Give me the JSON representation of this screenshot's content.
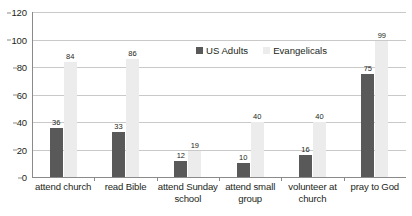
{
  "chart_data": {
    "type": "bar",
    "title": "",
    "xlabel": "",
    "ylabel": "",
    "ylim": [
      0,
      120
    ],
    "yticks": [
      0,
      20,
      40,
      60,
      80,
      100,
      120
    ],
    "grid": true,
    "legend_position": "top-center",
    "categories": [
      "attend church",
      "read Bible",
      "attend Sunday school",
      "attend small group",
      "volunteer at church",
      "pray to God"
    ],
    "series": [
      {
        "name": "US Adults",
        "color": "#595959",
        "values": [
          36,
          33,
          12,
          10,
          16,
          75
        ]
      },
      {
        "name": "Evangelicals",
        "color": "#ececec",
        "values": [
          84,
          86,
          19,
          40,
          40,
          99
        ]
      }
    ]
  },
  "legend": {
    "items": [
      {
        "label": "US Adults",
        "swatch": "dark"
      },
      {
        "label": "Evangelicals",
        "swatch": "light"
      }
    ]
  },
  "axes": {
    "y_tick_labels": [
      "120",
      "100",
      "80",
      "60",
      "40",
      "20",
      "0"
    ]
  }
}
